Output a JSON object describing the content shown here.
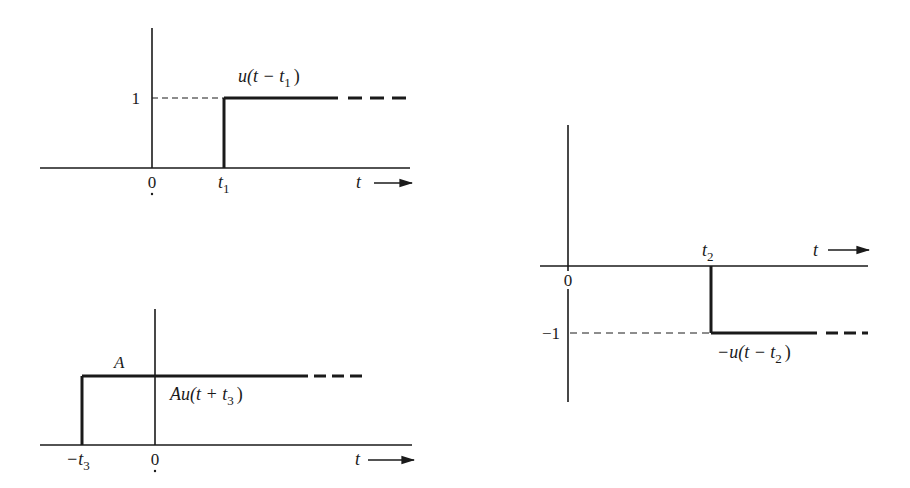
{
  "colors": {
    "ink": "#1a1a1a",
    "background": "#ffffff"
  },
  "diagrams": [
    {
      "id": "shifted-step",
      "function_label": "u(t − t",
      "function_sub": "1",
      "function_close": ")",
      "level_label": "1",
      "origin_label": "0",
      "step_label": "t",
      "step_sub": "1",
      "axis_label": "t"
    },
    {
      "id": "negative-shifted-step",
      "function_label": "−u(t − t",
      "function_sub": "2",
      "function_close": ")",
      "level_label": "−1",
      "origin_label": "0",
      "step_label": "t",
      "step_sub": "2",
      "axis_label": "t"
    },
    {
      "id": "scaled-advanced-step",
      "function_label": "Au(t + t",
      "function_sub": "3",
      "function_close": ")",
      "level_label": "A",
      "origin_label": "0",
      "step_label": "−t",
      "step_sub": "3",
      "axis_label": "t"
    }
  ]
}
